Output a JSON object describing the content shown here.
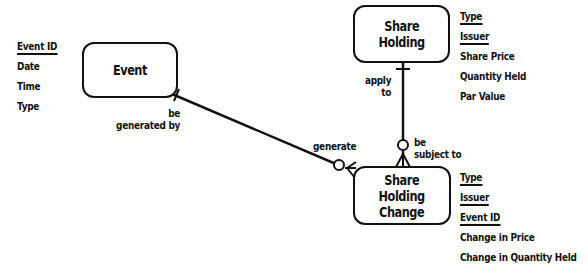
{
  "diagram": {
    "type": "entity-relationship",
    "entities": [
      {
        "id": "event",
        "name": "Event",
        "attributes": [
          {
            "name": "Event ID",
            "key": true
          },
          {
            "name": "Date",
            "key": false
          },
          {
            "name": "Time",
            "key": false
          },
          {
            "name": "Type",
            "key": false
          }
        ]
      },
      {
        "id": "share-holding",
        "name": "Share\nHolding",
        "attributes": [
          {
            "name": "Type",
            "key": true
          },
          {
            "name": "Issuer",
            "key": true
          },
          {
            "name": "Share Price",
            "key": false
          },
          {
            "name": "Quantity Held",
            "key": false
          },
          {
            "name": "Par Value",
            "key": false
          }
        ]
      },
      {
        "id": "share-holding-change",
        "name": "Share\nHolding\nChange",
        "attributes": [
          {
            "name": "Type",
            "key": true
          },
          {
            "name": "Issuer",
            "key": true
          },
          {
            "name": "Event ID",
            "key": true
          },
          {
            "name": "Change in Price",
            "key": false
          },
          {
            "name": "Change in Quantity Held",
            "key": false
          }
        ]
      }
    ],
    "relationships": [
      {
        "from": "event",
        "to": "share-holding-change",
        "from_label": "be\ngenerated by",
        "to_label": "generate",
        "from_cardinality": "exactly-one",
        "to_cardinality": "zero-or-many"
      },
      {
        "from": "share-holding",
        "to": "share-holding-change",
        "from_label": "apply\nto",
        "to_label": "be\nsubject to",
        "from_cardinality": "exactly-one",
        "to_cardinality": "zero-or-many"
      }
    ],
    "colors": {
      "stroke": "#111111",
      "background": "#ffffff"
    }
  }
}
